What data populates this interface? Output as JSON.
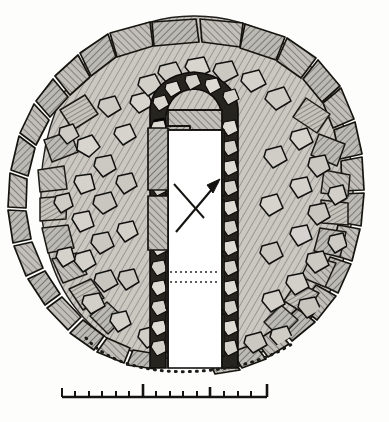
{
  "figure": {
    "kind": "archaeological-plan",
    "background_color": "#fdfdfc",
    "ink_color": "#1a1a1a",
    "stone_fill_color": "#b9b7b2",
    "rubble_fill_color": "#cdcac4",
    "hatch_color": "#5e5c58",
    "chamber_void_color": "#ffffff"
  },
  "north_arrow": {
    "name": "north-arrow",
    "direction": "up-right",
    "has_cross_stroke": true
  },
  "annotations": {
    "interior_dotted_line_count": 2,
    "outer_dotted_arc": "dotted arc along lower left edge of cairn"
  },
  "scale_bar": {
    "label_5": "5",
    "label_10": "10",
    "label_15": "15",
    "unit_label": "FEET.",
    "min": 0,
    "max": 15,
    "major_ticks": [
      0,
      5,
      10,
      15
    ],
    "minor_tick_step": 1,
    "bar_left_px": 62,
    "bar_right_px": 267
  }
}
